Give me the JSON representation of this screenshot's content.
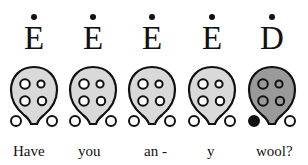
{
  "colors": {
    "body_light": "#d9d9d9",
    "body_dark": "#9a9a9a",
    "outline": "#111111",
    "hole_open": "#ffffff",
    "hole_closed": "#111111"
  },
  "notes": [
    {
      "letter": "E",
      "dotted": true,
      "body": "light",
      "holes": {
        "top_left": "open",
        "top_right": "open",
        "bottom_left": "open",
        "bottom_right": "open",
        "thumb_left": "open",
        "thumb_right": "open"
      },
      "lyric": "Have"
    },
    {
      "letter": "E",
      "dotted": true,
      "body": "light",
      "holes": {
        "top_left": "open",
        "top_right": "open",
        "bottom_left": "open",
        "bottom_right": "open",
        "thumb_left": "open",
        "thumb_right": "open"
      },
      "lyric": "you"
    },
    {
      "letter": "E",
      "dotted": true,
      "body": "light",
      "holes": {
        "top_left": "open",
        "top_right": "open",
        "bottom_left": "open",
        "bottom_right": "open",
        "thumb_left": "open",
        "thumb_right": "open"
      },
      "lyric": "an -"
    },
    {
      "letter": "E",
      "dotted": true,
      "body": "light",
      "holes": {
        "top_left": "open",
        "top_right": "open",
        "bottom_left": "open",
        "bottom_right": "open",
        "thumb_left": "open",
        "thumb_right": "open"
      },
      "lyric": "y"
    },
    {
      "letter": "D",
      "dotted": true,
      "body": "dark",
      "holes": {
        "top_left": "open",
        "top_right": "open",
        "bottom_left": "open",
        "bottom_right": "open",
        "thumb_left": "closed",
        "thumb_right": "open"
      },
      "lyric": "wool?"
    }
  ]
}
